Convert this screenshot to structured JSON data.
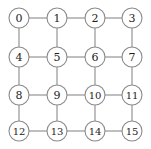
{
  "diagram": {
    "type": "grid-graph",
    "rows": 4,
    "cols": 4,
    "geometry": {
      "width": 151,
      "height": 149,
      "node_radius": 10,
      "x_positions": [
        19,
        57,
        95,
        132
      ],
      "y_positions": [
        18,
        57,
        95,
        131
      ]
    },
    "colors": {
      "background": "#ffffff",
      "node_fill": "#ffffff",
      "node_stroke": "#8a8a8a",
      "edge_stroke": "#8a8a8a",
      "label_text": "#1c1c1c"
    },
    "nodes": [
      {
        "id": 0,
        "label": "0",
        "row": 0,
        "col": 0,
        "cx": 19,
        "cy": 18
      },
      {
        "id": 1,
        "label": "1",
        "row": 0,
        "col": 1,
        "cx": 57,
        "cy": 18
      },
      {
        "id": 2,
        "label": "2",
        "row": 0,
        "col": 2,
        "cx": 95,
        "cy": 18
      },
      {
        "id": 3,
        "label": "3",
        "row": 0,
        "col": 3,
        "cx": 132,
        "cy": 18
      },
      {
        "id": 4,
        "label": "4",
        "row": 1,
        "col": 0,
        "cx": 19,
        "cy": 57
      },
      {
        "id": 5,
        "label": "5",
        "row": 1,
        "col": 1,
        "cx": 57,
        "cy": 57
      },
      {
        "id": 6,
        "label": "6",
        "row": 1,
        "col": 2,
        "cx": 95,
        "cy": 57
      },
      {
        "id": 7,
        "label": "7",
        "row": 1,
        "col": 3,
        "cx": 132,
        "cy": 57
      },
      {
        "id": 8,
        "label": "8",
        "row": 2,
        "col": 0,
        "cx": 19,
        "cy": 95
      },
      {
        "id": 9,
        "label": "9",
        "row": 2,
        "col": 1,
        "cx": 57,
        "cy": 95
      },
      {
        "id": 10,
        "label": "10",
        "row": 2,
        "col": 2,
        "cx": 95,
        "cy": 95
      },
      {
        "id": 11,
        "label": "11",
        "row": 2,
        "col": 3,
        "cx": 132,
        "cy": 95
      },
      {
        "id": 12,
        "label": "12",
        "row": 3,
        "col": 0,
        "cx": 19,
        "cy": 131
      },
      {
        "id": 13,
        "label": "13",
        "row": 3,
        "col": 1,
        "cx": 57,
        "cy": 131
      },
      {
        "id": 14,
        "label": "14",
        "row": 3,
        "col": 2,
        "cx": 95,
        "cy": 131
      },
      {
        "id": 15,
        "label": "15",
        "row": 3,
        "col": 3,
        "cx": 132,
        "cy": 131
      }
    ],
    "edges": [
      {
        "from": 0,
        "to": 1,
        "orientation": "horizontal"
      },
      {
        "from": 1,
        "to": 2,
        "orientation": "horizontal"
      },
      {
        "from": 2,
        "to": 3,
        "orientation": "horizontal"
      },
      {
        "from": 4,
        "to": 5,
        "orientation": "horizontal"
      },
      {
        "from": 5,
        "to": 6,
        "orientation": "horizontal"
      },
      {
        "from": 6,
        "to": 7,
        "orientation": "horizontal"
      },
      {
        "from": 8,
        "to": 9,
        "orientation": "horizontal"
      },
      {
        "from": 9,
        "to": 10,
        "orientation": "horizontal"
      },
      {
        "from": 10,
        "to": 11,
        "orientation": "horizontal"
      },
      {
        "from": 12,
        "to": 13,
        "orientation": "horizontal"
      },
      {
        "from": 13,
        "to": 14,
        "orientation": "horizontal"
      },
      {
        "from": 14,
        "to": 15,
        "orientation": "horizontal"
      },
      {
        "from": 0,
        "to": 4,
        "orientation": "vertical"
      },
      {
        "from": 1,
        "to": 5,
        "orientation": "vertical"
      },
      {
        "from": 2,
        "to": 6,
        "orientation": "vertical"
      },
      {
        "from": 3,
        "to": 7,
        "orientation": "vertical"
      },
      {
        "from": 4,
        "to": 8,
        "orientation": "vertical"
      },
      {
        "from": 5,
        "to": 9,
        "orientation": "vertical"
      },
      {
        "from": 6,
        "to": 10,
        "orientation": "vertical"
      },
      {
        "from": 7,
        "to": 11,
        "orientation": "vertical"
      },
      {
        "from": 8,
        "to": 12,
        "orientation": "vertical"
      },
      {
        "from": 9,
        "to": 13,
        "orientation": "vertical"
      },
      {
        "from": 10,
        "to": 14,
        "orientation": "vertical"
      },
      {
        "from": 11,
        "to": 15,
        "orientation": "vertical"
      }
    ]
  }
}
